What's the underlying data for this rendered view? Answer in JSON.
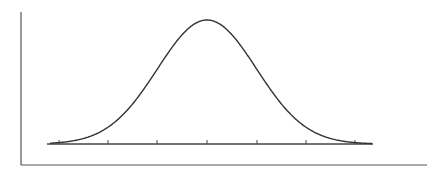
{
  "chart_data": {
    "type": "line",
    "title": "",
    "xlabel": "",
    "ylabel": "",
    "x_ticks": [
      -3,
      -2,
      -1,
      0,
      1,
      2,
      3
    ],
    "x_tick_labels": [],
    "curve": "gaussian",
    "mean": 0,
    "std": 1,
    "xlim": [
      -3.3,
      3.4
    ],
    "grid": false,
    "legend": null
  },
  "colors": {
    "curve": "#333333",
    "axis": "#555555",
    "baseline": "#444444",
    "background": "#ffffff"
  },
  "geometry": {
    "left_axis": {
      "x": 21,
      "y1": 12,
      "y2": 165
    },
    "bottom_axis": {
      "y": 165,
      "x1": 21,
      "x2": 427
    },
    "baseline": {
      "y": 144,
      "x1": 47,
      "x2": 373
    },
    "tick_xs": [
      59,
      108,
      157,
      207,
      257,
      306,
      355
    ],
    "peak": {
      "x": 207,
      "y": 20
    },
    "sigma_px": 49.5
  }
}
